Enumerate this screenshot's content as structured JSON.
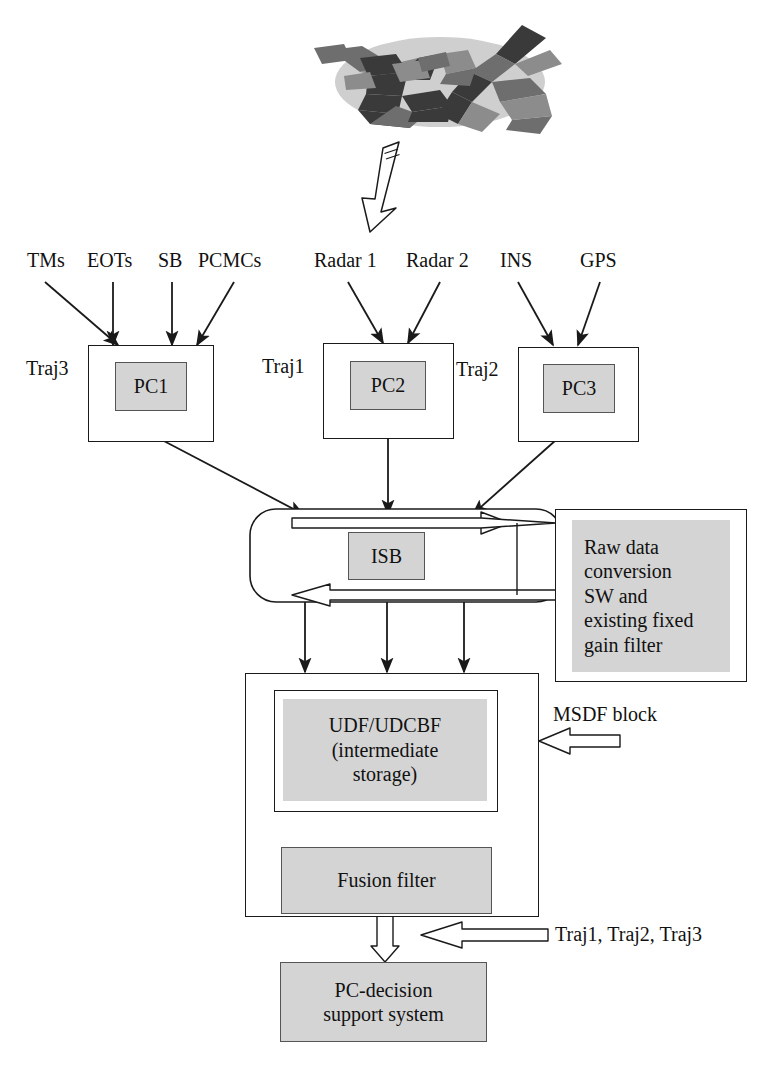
{
  "diagram": {
    "colors": {
      "fill_gray": "#d4d4d4",
      "line": "#1a1a1a",
      "box_border_gray": "#555555",
      "plane_light": "#cfcfcf",
      "plane_mid": "#8c8c8c",
      "plane_dark": "#3a3a3a",
      "page_bg": "#ffffff"
    },
    "source_labels": {
      "group_pc1": [
        "TMs",
        "EOTs",
        "SB",
        "PCMCs"
      ],
      "group_pc2": [
        "Radar 1",
        "Radar 2"
      ],
      "group_pc3": [
        "INS",
        "GPS"
      ]
    },
    "trajectory_labels": {
      "pc1": "Traj3",
      "pc2": "Traj1",
      "pc3": "Traj2"
    },
    "processing_nodes": [
      {
        "id": "pc1",
        "label": "PC1"
      },
      {
        "id": "pc2",
        "label": "PC2"
      },
      {
        "id": "pc3",
        "label": "PC3"
      }
    ],
    "isb": {
      "label": "ISB"
    },
    "raw_data_block": {
      "label": "Raw data conversion SW and existing fixed gain filter",
      "lines": [
        "Raw data",
        "conversion",
        "SW and",
        "existing fixed",
        "gain filter"
      ]
    },
    "msdf": {
      "annotation": "MSDF block",
      "udf": {
        "label": "UDF/UDCBF (intermediate storage)",
        "lines": [
          "UDF/UDCBF",
          "(intermediate",
          "storage)"
        ]
      },
      "fusion_filter": {
        "label": "Fusion filter"
      }
    },
    "output_block": {
      "label": "PC-decision support system",
      "lines": [
        "PC-decision",
        "support system"
      ]
    },
    "feedback_annotation": "Traj1, Traj2, Traj3",
    "top_image": {
      "name": "aircraft-illustration",
      "caption": ""
    }
  }
}
